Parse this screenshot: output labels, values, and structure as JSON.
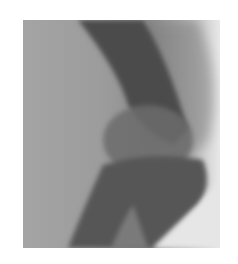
{
  "image": {
    "description": "Grayscale lateral radiograph of a flexed joint (elbow) showing bone shafts meeting at the joint",
    "colors": {
      "background": "#ffffff",
      "soft_tissue": "#9e9e9e",
      "bone_dark": "#4a4a4a",
      "bone_mid": "#6a6a6a",
      "edge_light": "#e8e8e8"
    }
  }
}
